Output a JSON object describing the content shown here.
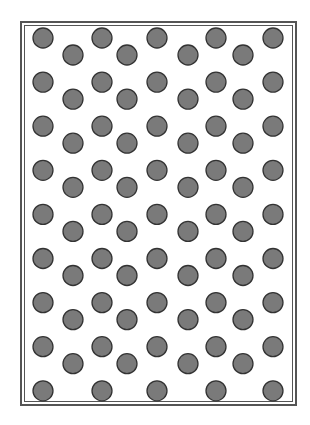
{
  "pattern": {
    "description": "Staggered dot grid inside a double-line rectangular frame",
    "colors": {
      "dot_fill": "#7a7a7a",
      "dot_stroke": "#333333",
      "frame": "#555555",
      "background": "#ffffff"
    },
    "grid": {
      "primary_rows": 9,
      "primary_columns": 5,
      "offset_rows": 8,
      "offset_columns": 4
    }
  }
}
